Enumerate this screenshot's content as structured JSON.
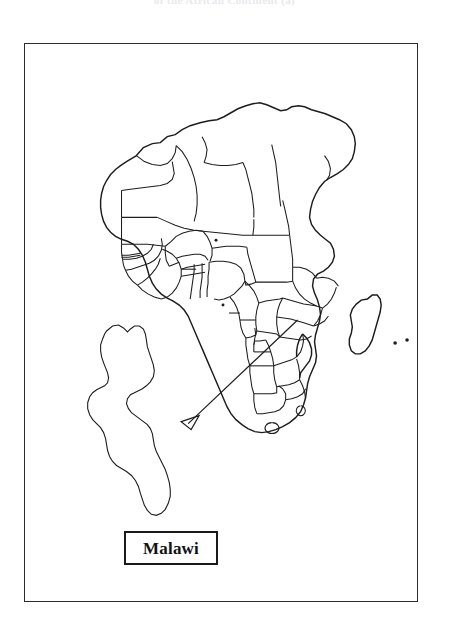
{
  "figure": {
    "title": "of the African Continent (a)",
    "caption_label": "Malawi",
    "frame": {
      "x": 24,
      "y": 43,
      "width": 394,
      "height": 559
    }
  },
  "colors": {
    "ink": "#1d1d1d",
    "frame": "#2b2b2b",
    "background": "#ffffff",
    "title_faded": "#e9e9ec"
  },
  "map": {
    "name": "africa-political-outline",
    "projection_note": "outline map, country borders, no fills",
    "features": [
      {
        "name": "africa-mainland-coastline",
        "type": "coastline"
      },
      {
        "name": "country-borders",
        "type": "borders"
      },
      {
        "name": "madagascar",
        "type": "island"
      },
      {
        "name": "indian-ocean-islets",
        "type": "islet-dots",
        "count": 2
      },
      {
        "name": "gulf-of-guinea-islets",
        "type": "islet-dots",
        "count": 2
      },
      {
        "name": "lesotho-enclave",
        "type": "enclave"
      },
      {
        "name": "malawi-highlight",
        "type": "highlighted-country"
      }
    ]
  },
  "inset": {
    "name": "malawi-enlarged-outline",
    "label": "Malawi"
  },
  "pointer": {
    "name": "malawi-callout-arrow",
    "from": {
      "x": 295,
      "y": 318
    },
    "to": {
      "x": 181,
      "y": 422
    },
    "style": "open-arrowhead"
  }
}
